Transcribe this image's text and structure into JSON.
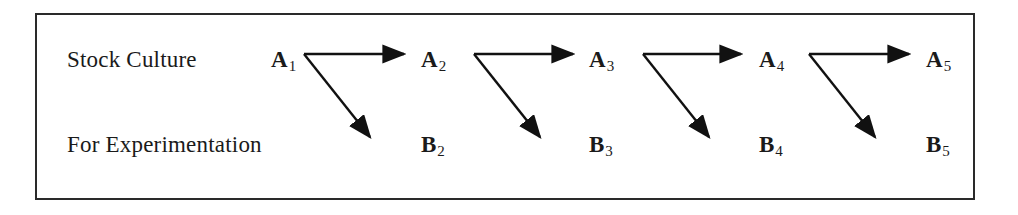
{
  "diagram": {
    "rows": [
      {
        "label": "Stock Culture"
      },
      {
        "label": "For Experimentation"
      }
    ],
    "nodes": {
      "top": [
        {
          "letter": "A",
          "index": "1"
        },
        {
          "letter": "A",
          "index": "2"
        },
        {
          "letter": "A",
          "index": "3"
        },
        {
          "letter": "A",
          "index": "4"
        },
        {
          "letter": "A",
          "index": "5"
        }
      ],
      "bottom": [
        {
          "letter": "B",
          "index": "2"
        },
        {
          "letter": "B",
          "index": "3"
        },
        {
          "letter": "B",
          "index": "4"
        },
        {
          "letter": "B",
          "index": "5"
        }
      ]
    },
    "edges": [
      {
        "from": "A1",
        "to": "A2"
      },
      {
        "from": "A1",
        "to": "B2"
      },
      {
        "from": "A2",
        "to": "A3"
      },
      {
        "from": "A2",
        "to": "B3"
      },
      {
        "from": "A3",
        "to": "A4"
      },
      {
        "from": "A3",
        "to": "B4"
      },
      {
        "from": "A4",
        "to": "A5"
      },
      {
        "from": "A4",
        "to": "B5"
      }
    ]
  }
}
